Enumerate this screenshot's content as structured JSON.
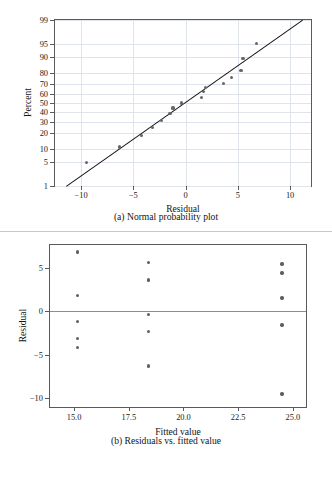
{
  "figure": {
    "panels": [
      {
        "id": "a",
        "caption": "(a) Normal probability plot",
        "xlabel": "Residual",
        "ylabel": "Percent"
      },
      {
        "id": "b",
        "caption": "(b) Residuals vs. fitted value",
        "xlabel": "Fitted value",
        "ylabel": "Residual"
      }
    ]
  },
  "chart_data": [
    {
      "type": "scatter",
      "title": "(a) Normal probability plot",
      "xlabel": "Residual",
      "ylabel": "Percent",
      "xlim": [
        -12.5,
        12.0
      ],
      "ylim_percent": [
        1,
        99
      ],
      "yscale": "normal-probability",
      "grid": true,
      "xticks": [
        -10,
        -5,
        0,
        5,
        10
      ],
      "xtick_labels": [
        "−10",
        "−5",
        "0",
        "5",
        "10"
      ],
      "yticks": [
        1,
        5,
        10,
        20,
        30,
        40,
        50,
        60,
        70,
        80,
        90,
        95,
        99
      ],
      "ytick_labels": [
        "1",
        "5",
        "10",
        "20",
        "30",
        "40",
        "50",
        "60",
        "70",
        "80",
        "90",
        "95",
        "99"
      ],
      "points": [
        {
          "residual": -9.5,
          "percent": 4.7
        },
        {
          "residual": -6.3,
          "percent": 10.9
        },
        {
          "residual": -4.2,
          "percent": 18.2
        },
        {
          "residual": -3.2,
          "percent": 24.5
        },
        {
          "residual": -2.3,
          "percent": 31.3
        },
        {
          "residual": -1.5,
          "percent": 38.0
        },
        {
          "residual": -1.2,
          "percent": 44.5
        },
        {
          "residual": -0.4,
          "percent": 50.0
        },
        {
          "residual": 1.5,
          "percent": 56.5
        },
        {
          "residual": 1.7,
          "percent": 62.5
        },
        {
          "residual": 1.9,
          "percent": 66.5
        },
        {
          "residual": 3.6,
          "percent": 70.5
        },
        {
          "residual": 4.4,
          "percent": 76.0
        },
        {
          "residual": 5.3,
          "percent": 82.0
        },
        {
          "residual": 5.5,
          "percent": 89.5
        },
        {
          "residual": 6.8,
          "percent": 95.3
        }
      ],
      "reference_line": {
        "label": "normal reference line",
        "from": {
          "residual": -11.4,
          "percent": 1
        },
        "to": {
          "residual": 11.2,
          "percent": 99
        }
      },
      "legend": null
    },
    {
      "type": "scatter",
      "title": "(b) Residuals vs. fitted value",
      "xlabel": "Fitted value",
      "ylabel": "Residual",
      "xlim": [
        13.9,
        25.6
      ],
      "ylim": [
        -11.0,
        7.6
      ],
      "grid": false,
      "xticks": [
        15.0,
        17.5,
        20.0,
        22.5,
        25.0
      ],
      "xtick_labels": [
        "15.0",
        "17.5",
        "20.0",
        "22.5",
        "25.0"
      ],
      "yticks": [
        5,
        0,
        -5,
        -10
      ],
      "ytick_labels": [
        "5",
        "0",
        "−5",
        "−10"
      ],
      "zero_reference_line": 0,
      "points": [
        {
          "fitted": 15.15,
          "residual": 6.8
        },
        {
          "fitted": 15.15,
          "residual": 1.8
        },
        {
          "fitted": 15.15,
          "residual": -1.2
        },
        {
          "fitted": 15.15,
          "residual": -3.1
        },
        {
          "fitted": 15.15,
          "residual": -4.2
        },
        {
          "fitted": 18.4,
          "residual": 5.6
        },
        {
          "fitted": 18.4,
          "residual": 3.6
        },
        {
          "fitted": 18.4,
          "residual": -0.4
        },
        {
          "fitted": 18.4,
          "residual": -2.3
        },
        {
          "fitted": 18.4,
          "residual": -6.3
        },
        {
          "fitted": 24.5,
          "residual": 5.4
        },
        {
          "fitted": 24.5,
          "residual": 4.4
        },
        {
          "fitted": 24.5,
          "residual": 1.5
        },
        {
          "fitted": 24.5,
          "residual": -1.6
        },
        {
          "fitted": 24.5,
          "residual": -9.5
        }
      ],
      "legend": null
    }
  ]
}
